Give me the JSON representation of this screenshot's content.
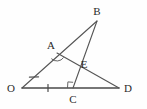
{
  "figure": {
    "canvas": {
      "width": 147,
      "height": 109
    },
    "stroke_color": "#555555",
    "base_stroke_color": "#4a4a4a",
    "label_color": "#2a2a2a",
    "background": "#fefefe"
  },
  "points": [
    {
      "id": "O",
      "label": "O",
      "x": 22,
      "y": 88,
      "label_x": 11,
      "label_y": 92
    },
    {
      "id": "A",
      "label": "A",
      "x": 57,
      "y": 53,
      "label_x": 51,
      "label_y": 49
    },
    {
      "id": "B",
      "label": "B",
      "x": 97,
      "y": 21,
      "label_x": 95,
      "label_y": 15
    },
    {
      "id": "E",
      "label": "E",
      "x": 79,
      "y": 63,
      "label_x": 83,
      "label_y": 67
    },
    {
      "id": "C",
      "label": "C",
      "x": 73,
      "y": 88,
      "label_x": 70,
      "label_y": 103
    },
    {
      "id": "D",
      "label": "D",
      "x": 119,
      "y": 88,
      "label_x": 126,
      "label_y": 92
    }
  ],
  "segments": [
    {
      "id": "OB",
      "from": "O",
      "to": "B",
      "x1": 22,
      "y1": 88,
      "x2": 97,
      "y2": 21
    },
    {
      "id": "OD",
      "from": "O",
      "to": "D",
      "x1": 22,
      "y1": 88,
      "x2": 119,
      "y2": 88
    },
    {
      "id": "AD",
      "from": "A",
      "to": "D",
      "x1": 57,
      "y1": 53,
      "x2": 119,
      "y2": 88
    },
    {
      "id": "BC",
      "from": "B",
      "to": "C",
      "x1": 97,
      "y1": 21,
      "x2": 73,
      "y2": 88
    }
  ],
  "marks": {
    "tick_OA": {
      "id": "tick-oa",
      "cx": 34,
      "cy": 77,
      "angle": -41.8
    },
    "tick_OC": {
      "id": "tick-oc",
      "cx": 48,
      "cy": 88,
      "angle": 0
    },
    "angle_arc_A": {
      "id": "arc-a",
      "cx": 57,
      "cy": 53,
      "radius": 8
    },
    "right_angle_C": {
      "id": "right-angle-c",
      "x": 73,
      "y": 88,
      "size": 6
    }
  },
  "legend": {
    "vertices": [
      "O",
      "A",
      "B",
      "E",
      "C",
      "D"
    ]
  }
}
